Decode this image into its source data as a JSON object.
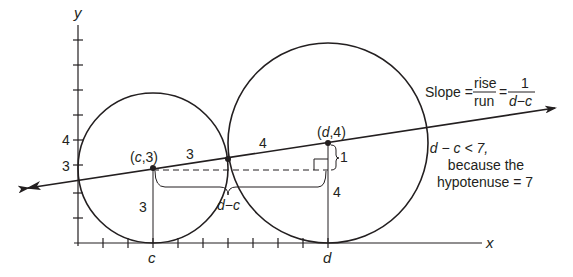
{
  "diagram": {
    "axes": {
      "x_label": "x",
      "y_label": "y",
      "y_tick_labels": {
        "four": "4",
        "three": "3"
      },
      "x_tick_labels": {
        "c": "c",
        "d": "d"
      }
    },
    "points": {
      "small_center": "(c,3)",
      "large_center": "(d,4)"
    },
    "segment_labels": {
      "small_radius_line": "3",
      "large_radius_line": "4",
      "small_vertical": "3",
      "large_vertical": "4",
      "rise": "1",
      "run": "d−c"
    },
    "slope_annotation": {
      "prefix": "Slope =",
      "rise": "rise",
      "run": "run",
      "eq": "=",
      "numerator": "1",
      "denominator": "d−c"
    },
    "note": {
      "line1": "d − c < 7,",
      "line2": "because the",
      "line3": "hypotenuse = 7"
    },
    "colors": {
      "ink": "#231f20",
      "background": "#ffffff"
    }
  }
}
